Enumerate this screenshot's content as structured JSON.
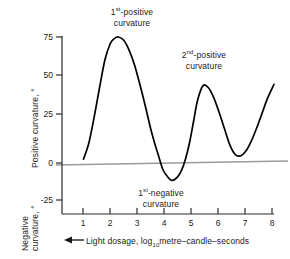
{
  "chart_data": {
    "type": "line",
    "title": "",
    "xlabel": "Light dosage, log10 metre-candle-seconds",
    "ylabel_positive": "Positive  curvature, °",
    "ylabel_negative_line1": "Negative",
    "ylabel_negative_line2": "curvature, °",
    "xlim": [
      0.1,
      8.0
    ],
    "ylim": [
      -33,
      80
    ],
    "x_ticks": [
      "1",
      "2",
      "3",
      "4",
      "5",
      "6",
      "7",
      "8"
    ],
    "x_tick_values": [
      1,
      2,
      3,
      4,
      5,
      6,
      7,
      8
    ],
    "y_ticks": [
      "75",
      "50",
      "25",
      "0",
      "-25"
    ],
    "y_tick_values": [
      75,
      50,
      25,
      0,
      -25
    ],
    "grid": false,
    "legend": "none",
    "zero_line": true,
    "series": [
      {
        "name": "phototropic curvature",
        "x": [
          0.9,
          1.1,
          1.3,
          1.5,
          1.7,
          1.9,
          2.05,
          2.2,
          2.4,
          2.6,
          2.8,
          3.0,
          3.2,
          3.4,
          3.55,
          3.7,
          3.85,
          4.0,
          4.2,
          4.4,
          4.55,
          4.7,
          4.85,
          5.0,
          5.15,
          5.35,
          5.55,
          5.75,
          5.95,
          6.15,
          6.35,
          6.55,
          6.75,
          6.95,
          7.15,
          7.35,
          7.55,
          7.75,
          8.0
        ],
        "y": [
          0,
          10,
          26,
          44,
          61,
          71,
          74,
          75,
          73,
          67,
          58,
          46,
          33,
          19,
          10,
          2,
          -6,
          -10,
          -13,
          -11,
          -7,
          0,
          10,
          23,
          36,
          45,
          44,
          38,
          29,
          19,
          9,
          3,
          2,
          5,
          11,
          19,
          28,
          37,
          46
        ]
      }
    ],
    "annotations": [
      {
        "id": "first-positive",
        "line1_pre": "1",
        "line1_sup": "st",
        "line1_post": "-positive",
        "line2": "curvature"
      },
      {
        "id": "second-positive",
        "line1_pre": "2",
        "line1_sup": "nd",
        "line1_post": "-positive",
        "line2": "curvature"
      },
      {
        "id": "first-negative",
        "line1_pre": "1",
        "line1_sup": "st",
        "line1_post": "-negative",
        "line2": "curvature"
      }
    ],
    "axis_color": "#2a2a2a",
    "curve_color": "#000000",
    "zero_line_color": "#9a9a9a"
  },
  "axis": {
    "x_label_prefix_arrow": "←",
    "x_label_text_a": "Light  dosage,  log",
    "x_label_sub": "10",
    "x_label_text_b": "metre–candle–seconds"
  }
}
